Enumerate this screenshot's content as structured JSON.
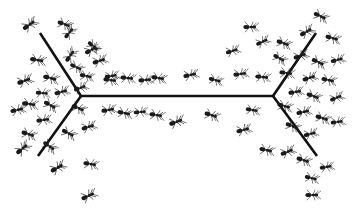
{
  "figure": {
    "background_color": "#ffffff",
    "ink_color": "#111111",
    "width": 354,
    "height": 218
  },
  "trail": {
    "name": "double-y-bridge",
    "stroke_color": "#111111",
    "stroke_width": 2.6,
    "left_vertex": {
      "x": 81,
      "y": 96
    },
    "right_vertex": {
      "x": 273,
      "y": 96
    },
    "segments": [
      {
        "name": "left-upper-branch",
        "x1": 40,
        "y1": 33,
        "x2": 81,
        "y2": 96
      },
      {
        "name": "left-lower-branch",
        "x1": 81,
        "y1": 96,
        "x2": 38,
        "y2": 156
      },
      {
        "name": "central-bridge",
        "x1": 81,
        "y1": 96,
        "x2": 273,
        "y2": 96
      },
      {
        "name": "right-upper-branch",
        "x1": 273,
        "y1": 96,
        "x2": 316,
        "y2": 33
      },
      {
        "name": "right-lower-branch",
        "x1": 273,
        "y1": 96,
        "x2": 317,
        "y2": 156
      }
    ]
  },
  "ants": {
    "count": 74,
    "body_color": "#1a1a1a",
    "limb_color": "#262626",
    "items": [
      {
        "x": 29,
        "y": 25,
        "s": 1.0,
        "r": -35
      },
      {
        "x": 64,
        "y": 24,
        "s": 0.95,
        "r": 20
      },
      {
        "x": 91,
        "y": 50,
        "s": 0.95,
        "r": -30
      },
      {
        "x": 37,
        "y": 60,
        "s": 1.0,
        "r": 10
      },
      {
        "x": 70,
        "y": 56,
        "s": 0.95,
        "r": -55
      },
      {
        "x": 76,
        "y": 67,
        "s": 0.9,
        "r": 25
      },
      {
        "x": 24,
        "y": 81,
        "s": 1.0,
        "r": -20
      },
      {
        "x": 50,
        "y": 78,
        "s": 1.0,
        "r": 15
      },
      {
        "x": 61,
        "y": 92,
        "s": 0.95,
        "r": -15
      },
      {
        "x": 29,
        "y": 104,
        "s": 1.0,
        "r": 8
      },
      {
        "x": 17,
        "y": 110,
        "s": 0.95,
        "r": -12
      },
      {
        "x": 50,
        "y": 105,
        "s": 0.95,
        "r": 30
      },
      {
        "x": 43,
        "y": 120,
        "s": 0.95,
        "r": -8
      },
      {
        "x": 28,
        "y": 134,
        "s": 0.95,
        "r": 18
      },
      {
        "x": 22,
        "y": 149,
        "s": 1.0,
        "r": -40
      },
      {
        "x": 49,
        "y": 146,
        "s": 0.95,
        "r": 35
      },
      {
        "x": 57,
        "y": 168,
        "s": 1.0,
        "r": -30
      },
      {
        "x": 90,
        "y": 164,
        "s": 0.95,
        "r": 10
      },
      {
        "x": 88,
        "y": 196,
        "s": 1.0,
        "r": -25
      },
      {
        "x": 69,
        "y": 33,
        "s": 0.9,
        "r": -50
      },
      {
        "x": 93,
        "y": 46,
        "s": 0.9,
        "r": 40
      },
      {
        "x": 80,
        "y": 88,
        "s": 0.9,
        "r": -20
      },
      {
        "x": 99,
        "y": 61,
        "s": 0.95,
        "r": -18
      },
      {
        "x": 78,
        "y": 108,
        "s": 0.95,
        "r": 22
      },
      {
        "x": 88,
        "y": 127,
        "s": 0.95,
        "r": -18
      },
      {
        "x": 68,
        "y": 133,
        "s": 0.95,
        "r": 28
      },
      {
        "x": 42,
        "y": 93,
        "s": 0.9,
        "r": 5
      },
      {
        "x": 86,
        "y": 76,
        "s": 0.9,
        "r": 12
      },
      {
        "x": 110,
        "y": 80,
        "s": 0.95,
        "r": 8
      },
      {
        "x": 111,
        "y": 76,
        "s": 0.9,
        "r": -10
      },
      {
        "x": 127,
        "y": 78,
        "s": 0.95,
        "r": 6
      },
      {
        "x": 145,
        "y": 80,
        "s": 0.95,
        "r": -5
      },
      {
        "x": 158,
        "y": 78,
        "s": 0.95,
        "r": 10
      },
      {
        "x": 190,
        "y": 75,
        "s": 0.95,
        "r": -12
      },
      {
        "x": 215,
        "y": 80,
        "s": 0.9,
        "r": 15
      },
      {
        "x": 240,
        "y": 74,
        "s": 0.95,
        "r": -8
      },
      {
        "x": 262,
        "y": 77,
        "s": 0.95,
        "r": 6
      },
      {
        "x": 108,
        "y": 110,
        "s": 0.95,
        "r": -10
      },
      {
        "x": 124,
        "y": 113,
        "s": 0.95,
        "r": 12
      },
      {
        "x": 140,
        "y": 112,
        "s": 0.9,
        "r": -6
      },
      {
        "x": 156,
        "y": 115,
        "s": 0.95,
        "r": 10
      },
      {
        "x": 176,
        "y": 122,
        "s": 1.0,
        "r": -20
      },
      {
        "x": 211,
        "y": 115,
        "s": 0.95,
        "r": 18
      },
      {
        "x": 243,
        "y": 130,
        "s": 0.95,
        "r": -15
      },
      {
        "x": 252,
        "y": 110,
        "s": 0.9,
        "r": 10
      },
      {
        "x": 250,
        "y": 27,
        "s": 0.95,
        "r": 0
      },
      {
        "x": 320,
        "y": 16,
        "s": 0.95,
        "r": 25
      },
      {
        "x": 306,
        "y": 32,
        "s": 0.95,
        "r": -30
      },
      {
        "x": 283,
        "y": 43,
        "s": 0.95,
        "r": 20
      },
      {
        "x": 262,
        "y": 42,
        "s": 0.9,
        "r": -25
      },
      {
        "x": 332,
        "y": 38,
        "s": 0.95,
        "r": 15
      },
      {
        "x": 279,
        "y": 58,
        "s": 0.9,
        "r": 30
      },
      {
        "x": 300,
        "y": 56,
        "s": 0.95,
        "r": -20
      },
      {
        "x": 318,
        "y": 62,
        "s": 0.95,
        "r": 25
      },
      {
        "x": 337,
        "y": 60,
        "s": 0.9,
        "r": -15
      },
      {
        "x": 286,
        "y": 73,
        "s": 0.95,
        "r": 8
      },
      {
        "x": 309,
        "y": 78,
        "s": 0.95,
        "r": -18
      },
      {
        "x": 328,
        "y": 80,
        "s": 0.95,
        "r": 12
      },
      {
        "x": 295,
        "y": 92,
        "s": 0.95,
        "r": -10
      },
      {
        "x": 313,
        "y": 96,
        "s": 0.95,
        "r": 20
      },
      {
        "x": 336,
        "y": 98,
        "s": 0.9,
        "r": -22
      },
      {
        "x": 284,
        "y": 106,
        "s": 0.95,
        "r": 15
      },
      {
        "x": 303,
        "y": 112,
        "s": 0.95,
        "r": -12
      },
      {
        "x": 322,
        "y": 118,
        "s": 0.95,
        "r": 18
      },
      {
        "x": 337,
        "y": 122,
        "s": 0.9,
        "r": -8
      },
      {
        "x": 292,
        "y": 126,
        "s": 0.95,
        "r": 22
      },
      {
        "x": 310,
        "y": 134,
        "s": 0.9,
        "r": -16
      },
      {
        "x": 266,
        "y": 150,
        "s": 0.95,
        "r": 12
      },
      {
        "x": 287,
        "y": 152,
        "s": 0.95,
        "r": -22
      },
      {
        "x": 303,
        "y": 160,
        "s": 0.95,
        "r": 18
      },
      {
        "x": 326,
        "y": 167,
        "s": 0.9,
        "r": -10
      },
      {
        "x": 311,
        "y": 178,
        "s": 0.9,
        "r": 14
      },
      {
        "x": 312,
        "y": 195,
        "s": 0.95,
        "r": 0
      },
      {
        "x": 232,
        "y": 51,
        "s": 0.9,
        "r": -18
      }
    ]
  }
}
